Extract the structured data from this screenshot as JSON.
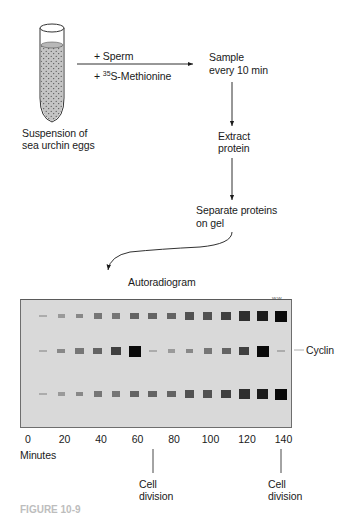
{
  "diagram": {
    "tube_label": [
      "Suspension of",
      "sea urchin eggs"
    ],
    "additions": {
      "top": "+ Sperm",
      "bottom_prefix": "+ ",
      "bottom_isotope_mass": "35",
      "bottom_suffix": "S-Methionine"
    },
    "steps": [
      {
        "line1": "Sample",
        "line2": "every 10 min"
      },
      {
        "line1": "Extract",
        "line2": "protein"
      },
      {
        "line1": "Separate proteins",
        "line2": "on gel"
      }
    ],
    "gel_title": "Autoradiogram",
    "row_labels": {
      "middle": "Cyclin"
    },
    "x_axis": {
      "ticks": [
        "0",
        "20",
        "40",
        "60",
        "80",
        "100",
        "120",
        "140"
      ],
      "label": "Minutes"
    },
    "events": [
      {
        "label_line1": "Cell",
        "label_line2": "division",
        "minute": 70
      },
      {
        "label_line1": "Cell",
        "label_line2": "division",
        "minute": 140
      }
    ],
    "figure_label": "FIGURE 10-9"
  },
  "chart_data": {
    "type": "heatmap",
    "title": "Autoradiogram",
    "xlabel": "Minutes",
    "x": [
      10,
      20,
      30,
      40,
      50,
      60,
      70,
      80,
      90,
      100,
      110,
      120,
      130,
      140
    ],
    "series": [
      {
        "name": "Top band (other protein)",
        "values": [
          1,
          2,
          3,
          4,
          4,
          5,
          5,
          5,
          6,
          6,
          7,
          8,
          9,
          10
        ]
      },
      {
        "name": "Cyclin",
        "values": [
          1,
          3,
          4,
          5,
          7,
          10,
          1,
          2,
          3,
          4,
          5,
          7,
          10,
          1
        ]
      },
      {
        "name": "Bottom band (other protein)",
        "values": [
          1,
          2,
          3,
          4,
          4,
          5,
          5,
          5,
          6,
          6,
          7,
          8,
          9,
          10
        ]
      }
    ],
    "annotations": [
      "Cell division at ~70 min",
      "Cell division at ~140 min"
    ]
  }
}
